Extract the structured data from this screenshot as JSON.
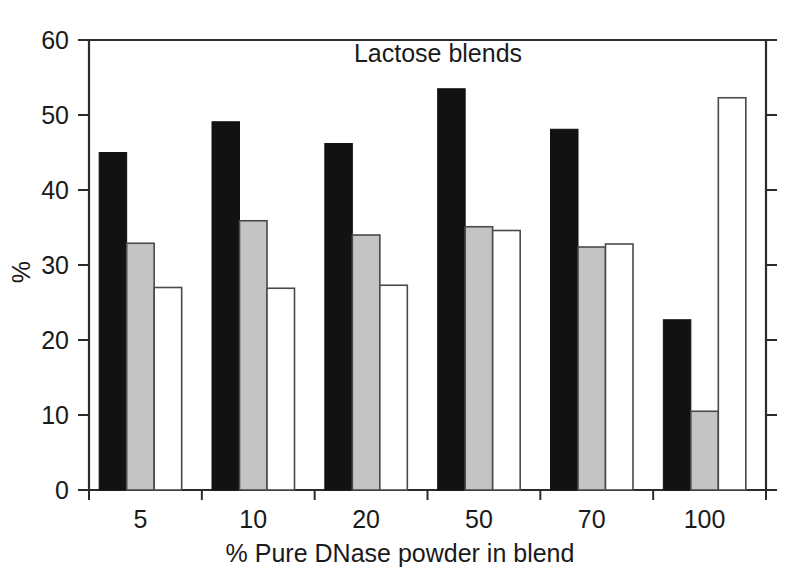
{
  "chart_data": {
    "type": "bar",
    "title": "Lactose blends",
    "xlabel": "% Pure DNase powder in blend",
    "ylabel": "%",
    "categories": [
      "5",
      "10",
      "20",
      "50",
      "70",
      "100"
    ],
    "series": [
      {
        "name": "black",
        "fill": "#121212",
        "values": [
          45.0,
          49.1,
          46.2,
          53.5,
          48.1,
          22.7
        ]
      },
      {
        "name": "gray",
        "fill": "#c4c4c4",
        "values": [
          32.9,
          35.9,
          34.0,
          35.1,
          32.4,
          10.5
        ]
      },
      {
        "name": "white",
        "fill": "#ffffff",
        "values": [
          27.0,
          26.9,
          27.3,
          34.6,
          32.8,
          52.3
        ]
      }
    ],
    "ylim": [
      0,
      60
    ],
    "yticks": [
      0,
      10,
      20,
      30,
      40,
      50,
      60
    ],
    "ytick_labels": [
      "0",
      "10",
      "20",
      "30",
      "40",
      "50",
      "60"
    ],
    "grid": false,
    "legend": "none",
    "title_position": "inside-top-center",
    "frame": "left-top-right-bottom"
  },
  "colors": {
    "axis": "#2b2b2b",
    "text": "#1a1a1a",
    "background": "#ffffff",
    "bar_black": "#121212",
    "bar_gray": "#c4c4c4",
    "bar_white_fill": "#ffffff",
    "bar_outline": "#4a4a4a"
  }
}
